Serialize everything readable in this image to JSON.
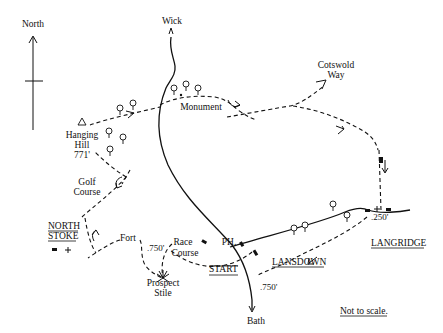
{
  "map": {
    "north_label": "North",
    "places": {
      "wick": "Wick",
      "bath": "Bath",
      "cotswold_way_line1": "Cotswold",
      "cotswold_way_line2": "Way",
      "monument": "Monument",
      "hanging_hill_line1": "Hanging",
      "hanging_hill_line2": "Hill",
      "hanging_hill_height": "771'",
      "golf_course_line1": "Golf",
      "golf_course_line2": "Course",
      "north_stoke_line1": "NORTH",
      "north_stoke_line2": "STOKE",
      "fort": "Fort",
      "fort_height": ".750'",
      "race_course_line1": "Race",
      "race_course_line2": "Course",
      "prospect_stile_line1": "Prospect",
      "prospect_stile_line2": "Stile",
      "pub": "PH.",
      "start": "START",
      "lansdown": "LANSDOWN",
      "langridge": "LANGRIDGE",
      "langridge_height": ".250'",
      "road_height": ".750'"
    },
    "scale_note": "Not to scale.",
    "icons": [
      "north-arrow-icon",
      "tree-icon",
      "trig-point-icon",
      "church-cross-icon",
      "building-icon",
      "viewpoint-icon",
      "direction-arrow-icon"
    ]
  }
}
